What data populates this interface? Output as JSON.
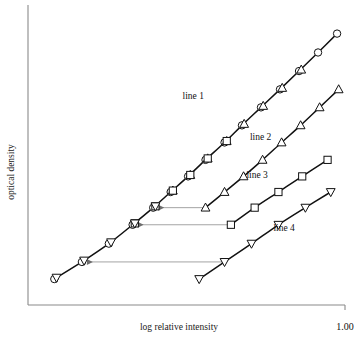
{
  "chart_data": {
    "type": "line",
    "title": "",
    "xlabel": "log relative intensity",
    "ylabel": "optical density",
    "grid": false,
    "legend_position": "inline-annotations",
    "xlim": [
      0.0,
      1.0
    ],
    "ylim": [
      0.0,
      1.0
    ],
    "xticks": [
      "1.00"
    ],
    "yticks": [],
    "annotations": [
      "line 1",
      "line 2",
      "line 3",
      "line 4"
    ],
    "series": [
      {
        "name": "line 1",
        "marker": "circle",
        "label": "line 1",
        "x": [
          0.083,
          0.17,
          0.255,
          0.33,
          0.395,
          0.45,
          0.505,
          0.56,
          0.62,
          0.675,
          0.735,
          0.795,
          0.855,
          0.915,
          0.975
        ],
        "y": [
          0.088,
          0.146,
          0.208,
          0.272,
          0.33,
          0.383,
          0.436,
          0.492,
          0.551,
          0.609,
          0.67,
          0.731,
          0.793,
          0.856,
          0.92
        ]
      },
      {
        "name": "line 2",
        "marker": "triangle-up",
        "label": "line 2",
        "x": [
          0.56,
          0.62,
          0.68,
          0.74,
          0.8,
          0.86,
          0.92,
          0.98
        ],
        "y": [
          0.33,
          0.383,
          0.436,
          0.492,
          0.551,
          0.609,
          0.67,
          0.731
        ]
      },
      {
        "name": "line 3",
        "marker": "square",
        "label": "line 3",
        "x": [
          0.64,
          0.715,
          0.79,
          0.865,
          0.945
        ],
        "y": [
          0.272,
          0.33,
          0.383,
          0.436,
          0.492
        ]
      },
      {
        "name": "line 4",
        "marker": "triangle-down",
        "label": "line 4",
        "x": [
          0.54,
          0.62,
          0.705,
          0.79,
          0.875,
          0.955
        ],
        "y": [
          0.088,
          0.146,
          0.208,
          0.272,
          0.33,
          0.383
        ]
      }
    ],
    "shift_arrows": [
      {
        "name": "arrow-line3-to-master",
        "from_x": 0.64,
        "from_y": 0.272,
        "to_x": 0.33,
        "to_y": 0.272
      },
      {
        "name": "arrow-line4-to-master",
        "from_x": 0.62,
        "from_y": 0.146,
        "to_x": 0.17,
        "to_y": 0.146
      },
      {
        "name": "arrow-line2-to-master",
        "from_x": 0.56,
        "from_y": 0.33,
        "to_x": 0.395,
        "to_y": 0.33
      }
    ]
  },
  "axes": {
    "x_label": "log relative intensity",
    "y_label": "optical density",
    "x_tick_label": "1.00"
  },
  "labels": {
    "line1": "line 1",
    "line2": "line 2",
    "line3": "line 3",
    "line4": "line 4"
  },
  "colors": {
    "axis": "#8a8a8a",
    "curve": "#111111",
    "arrow": "#9a9a9a",
    "text": "#1a1a1a",
    "background": "#ffffff"
  }
}
